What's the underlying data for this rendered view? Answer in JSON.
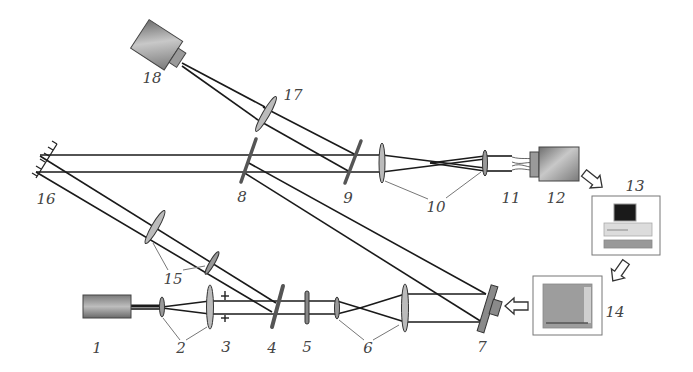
{
  "diagram": {
    "type": "optical-setup-schematic",
    "colors": {
      "beam": "#1a1a1a",
      "component_gray": "#8a8a8a",
      "device_gradient_light": "#c8c8c8",
      "device_gradient_dark": "#6e6e6e",
      "leader_line": "#777777",
      "label": "#444444"
    },
    "labels": [
      {
        "id": "1",
        "text": "1",
        "x": 97,
        "y": 348
      },
      {
        "id": "2",
        "text": "2",
        "x": 181,
        "y": 348
      },
      {
        "id": "3",
        "text": "3",
        "x": 226,
        "y": 347
      },
      {
        "id": "4",
        "text": "4",
        "x": 272,
        "y": 348
      },
      {
        "id": "5",
        "text": "5",
        "x": 307,
        "y": 347
      },
      {
        "id": "6",
        "text": "6",
        "x": 368,
        "y": 348
      },
      {
        "id": "7",
        "text": "7",
        "x": 482,
        "y": 347
      },
      {
        "id": "8",
        "text": "8",
        "x": 242,
        "y": 197
      },
      {
        "id": "9",
        "text": "9",
        "x": 348,
        "y": 198
      },
      {
        "id": "10",
        "text": "10",
        "x": 436,
        "y": 207
      },
      {
        "id": "11",
        "text": "11",
        "x": 511,
        "y": 198
      },
      {
        "id": "12",
        "text": "12",
        "x": 556,
        "y": 198
      },
      {
        "id": "13",
        "text": "13",
        "x": 635,
        "y": 186
      },
      {
        "id": "14",
        "text": "14",
        "x": 615,
        "y": 312
      },
      {
        "id": "15",
        "text": "15",
        "x": 173,
        "y": 279
      },
      {
        "id": "16",
        "text": "16",
        "x": 46,
        "y": 199
      },
      {
        "id": "17",
        "text": "17",
        "x": 293,
        "y": 95
      },
      {
        "id": "18",
        "text": "18",
        "x": 152,
        "y": 78
      }
    ],
    "components": [
      {
        "id": "1",
        "name": "laser"
      },
      {
        "id": "2",
        "name": "beam-expander-lenses"
      },
      {
        "id": "3",
        "name": "aperture"
      },
      {
        "id": "4",
        "name": "beam-splitter"
      },
      {
        "id": "5",
        "name": "polarizer"
      },
      {
        "id": "6",
        "name": "beam-expander-lenses"
      },
      {
        "id": "7",
        "name": "spatial-light-modulator"
      },
      {
        "id": "8",
        "name": "beam-splitter"
      },
      {
        "id": "9",
        "name": "beam-splitter"
      },
      {
        "id": "10",
        "name": "relay-lenses"
      },
      {
        "id": "11",
        "name": "fiber-bundle-input"
      },
      {
        "id": "12",
        "name": "camera"
      },
      {
        "id": "13",
        "name": "computer"
      },
      {
        "id": "14",
        "name": "controller"
      },
      {
        "id": "15",
        "name": "lenses"
      },
      {
        "id": "16",
        "name": "mirror"
      },
      {
        "id": "17",
        "name": "lens"
      },
      {
        "id": "18",
        "name": "camera"
      }
    ]
  }
}
